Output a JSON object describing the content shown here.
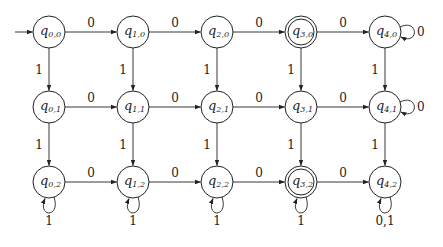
{
  "diagram": {
    "type": "dfa",
    "start_state": "q0,0",
    "accept_states": [
      "q3,0",
      "q3,2"
    ],
    "states": [
      {
        "id": "q0,0",
        "name": "q",
        "sub": "0,0",
        "col": 0,
        "row": 0
      },
      {
        "id": "q1,0",
        "name": "q",
        "sub": "1,0",
        "col": 1,
        "row": 0
      },
      {
        "id": "q2,0",
        "name": "q",
        "sub": "2,0",
        "col": 2,
        "row": 0
      },
      {
        "id": "q3,0",
        "name": "q",
        "sub": "3,0",
        "col": 3,
        "row": 0
      },
      {
        "id": "q4,0",
        "name": "q",
        "sub": "4,0",
        "col": 4,
        "row": 0
      },
      {
        "id": "q0,1",
        "name": "q",
        "sub": "0,1",
        "col": 0,
        "row": 1
      },
      {
        "id": "q1,1",
        "name": "q",
        "sub": "1,1",
        "col": 1,
        "row": 1
      },
      {
        "id": "q2,1",
        "name": "q",
        "sub": "2,1",
        "col": 2,
        "row": 1
      },
      {
        "id": "q3,1",
        "name": "q",
        "sub": "3,1",
        "col": 3,
        "row": 1
      },
      {
        "id": "q4,1",
        "name": "q",
        "sub": "4,1",
        "col": 4,
        "row": 1
      },
      {
        "id": "q0,2",
        "name": "q",
        "sub": "0,2",
        "col": 0,
        "row": 2
      },
      {
        "id": "q1,2",
        "name": "q",
        "sub": "1,2",
        "col": 1,
        "row": 2
      },
      {
        "id": "q2,2",
        "name": "q",
        "sub": "2,2",
        "col": 2,
        "row": 2
      },
      {
        "id": "q3,2",
        "name": "q",
        "sub": "3,2",
        "col": 3,
        "row": 2
      },
      {
        "id": "q4,2",
        "name": "q",
        "sub": "4,2",
        "col": 4,
        "row": 2
      }
    ],
    "transitions": [
      {
        "from": "q0,0",
        "to": "q1,0",
        "label": "0"
      },
      {
        "from": "q1,0",
        "to": "q2,0",
        "label": "0"
      },
      {
        "from": "q2,0",
        "to": "q3,0",
        "label": "0"
      },
      {
        "from": "q3,0",
        "to": "q4,0",
        "label": "0"
      },
      {
        "from": "q0,1",
        "to": "q1,1",
        "label": "0"
      },
      {
        "from": "q1,1",
        "to": "q2,1",
        "label": "0"
      },
      {
        "from": "q2,1",
        "to": "q3,1",
        "label": "0"
      },
      {
        "from": "q3,1",
        "to": "q4,1",
        "label": "0"
      },
      {
        "from": "q0,2",
        "to": "q1,2",
        "label": "0"
      },
      {
        "from": "q1,2",
        "to": "q2,2",
        "label": "0"
      },
      {
        "from": "q2,2",
        "to": "q3,2",
        "label": "0"
      },
      {
        "from": "q3,2",
        "to": "q4,2",
        "label": "0"
      },
      {
        "from": "q0,0",
        "to": "q0,1",
        "label": "1"
      },
      {
        "from": "q1,0",
        "to": "q1,1",
        "label": "1"
      },
      {
        "from": "q2,0",
        "to": "q2,1",
        "label": "1"
      },
      {
        "from": "q3,0",
        "to": "q3,1",
        "label": "1"
      },
      {
        "from": "q4,0",
        "to": "q4,1",
        "label": "1"
      },
      {
        "from": "q0,1",
        "to": "q0,2",
        "label": "1"
      },
      {
        "from": "q1,1",
        "to": "q1,2",
        "label": "1"
      },
      {
        "from": "q2,1",
        "to": "q2,2",
        "label": "1"
      },
      {
        "from": "q3,1",
        "to": "q3,2",
        "label": "1"
      },
      {
        "from": "q4,1",
        "to": "q4,2",
        "label": "1"
      },
      {
        "from": "q4,0",
        "to": "q4,0",
        "label": "0",
        "loop": "right"
      },
      {
        "from": "q4,1",
        "to": "q4,1",
        "label": "0",
        "loop": "right"
      },
      {
        "from": "q0,2",
        "to": "q0,2",
        "label": "1",
        "loop": "below"
      },
      {
        "from": "q1,2",
        "to": "q1,2",
        "label": "1",
        "loop": "below"
      },
      {
        "from": "q2,2",
        "to": "q2,2",
        "label": "1",
        "loop": "below"
      },
      {
        "from": "q3,2",
        "to": "q3,2",
        "label": "1",
        "loop": "below"
      },
      {
        "from": "q4,2",
        "to": "q4,2",
        "label": "0,1",
        "loop": "below"
      }
    ]
  }
}
